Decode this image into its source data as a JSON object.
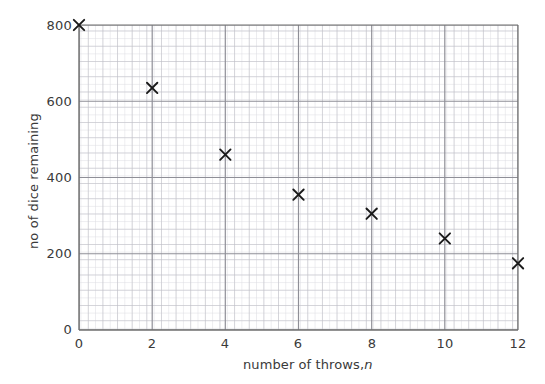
{
  "chart_data": {
    "type": "scatter",
    "title": "",
    "xlabel": "number of throws, n",
    "xlabel_plain": "number of throws,",
    "xlabel_italic": "n",
    "ylabel": "no of dice remaining",
    "xlim": [
      0,
      12
    ],
    "ylim": [
      0,
      800
    ],
    "xticks": [
      0,
      2,
      4,
      6,
      8,
      10,
      12
    ],
    "xtick_labels": [
      "0",
      "2",
      "4",
      "6",
      "8",
      "10",
      "12"
    ],
    "yticks": [
      0,
      200,
      400,
      600,
      800
    ],
    "ytick_labels": [
      "0",
      "200",
      "400",
      "600",
      "800"
    ],
    "grid": true,
    "grid_minor": true,
    "legend": "none",
    "marker": "x",
    "marker_color": "#1a1a1a",
    "x": [
      0,
      2,
      4,
      6,
      8,
      10,
      12
    ],
    "values": [
      800,
      635,
      460,
      355,
      305,
      240,
      175
    ],
    "points": [
      {
        "x": 0,
        "y": 800
      },
      {
        "x": 2,
        "y": 635
      },
      {
        "x": 4,
        "y": 460
      },
      {
        "x": 6,
        "y": 355
      },
      {
        "x": 8,
        "y": 305
      },
      {
        "x": 10,
        "y": 240
      },
      {
        "x": 12,
        "y": 175
      }
    ]
  },
  "colors": {
    "background": "#ffffff",
    "axis": "#6e6e6e",
    "grid_major": "#8f8f97",
    "grid_medium": "#b9b9c2",
    "grid_minor": "#dcdce2",
    "text": "#3a3a3a",
    "marker": "#1a1a1a"
  }
}
